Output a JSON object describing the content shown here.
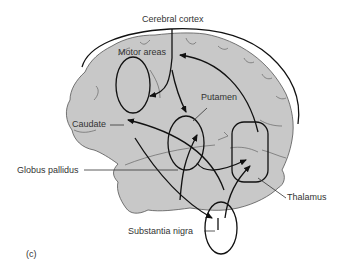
{
  "figure": {
    "panel_label": "(c)",
    "colors": {
      "brain_fill": "#c8c8c8",
      "brain_outline": "#555555",
      "pathway": "#111111",
      "label_text": "#333333",
      "background": "#ffffff"
    }
  },
  "labels": {
    "cerebral_cortex": "Cerebral cortex",
    "motor_areas": "Motor areas",
    "putamen": "Putamen",
    "caudate": "Caudate",
    "globus_pallidus": "Globus pallidus",
    "thalamus": "Thalamus",
    "substantia_nigra": "Substantia nigra"
  },
  "structures": [
    {
      "id": "cerebral-cortex",
      "shape": "bracket-arc"
    },
    {
      "id": "caudate",
      "shape": "ellipse"
    },
    {
      "id": "putamen",
      "shape": "ellipse"
    },
    {
      "id": "thalamus",
      "shape": "rounded-rect"
    },
    {
      "id": "substantia-nigra",
      "shape": "ellipse"
    }
  ],
  "pathways": [
    {
      "from": "cerebral-cortex",
      "to": "caudate"
    },
    {
      "from": "cerebral-cortex",
      "to": "putamen"
    },
    {
      "from": "thalamus",
      "to": "motor-areas"
    },
    {
      "from": "globus-pallidus",
      "to": "caudate"
    },
    {
      "from": "substantia-nigra",
      "to": "putamen"
    },
    {
      "from": "caudate",
      "to": "substantia-nigra"
    },
    {
      "from": "putamen",
      "to": "thalamus"
    },
    {
      "from": "substantia-nigra",
      "to": "thalamus"
    }
  ]
}
